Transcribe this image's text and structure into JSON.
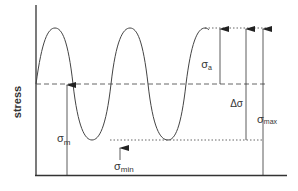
{
  "diagram": {
    "type": "cyclic stress waveform",
    "ylabel": "stress",
    "labels": {
      "sigma_a": "σa",
      "sigma_m": "σm",
      "sigma_min": "σmin",
      "delta_sigma": "Δσ",
      "sigma_max": "σmax"
    },
    "label_parts": {
      "sigma": "σ",
      "delta": "Δ",
      "a_sub": "a",
      "m_sub": "m",
      "min_sub": "min",
      "max_sub": "max"
    },
    "colors": {
      "line": "#333333",
      "background": "#ffffff"
    }
  }
}
